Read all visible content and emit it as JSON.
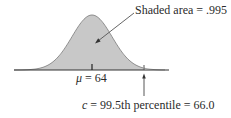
{
  "chart_data": {
    "type": "area",
    "title": "",
    "distribution": "normal",
    "mean": 64,
    "shaded_region": "left of c",
    "shaded_area": 0.995,
    "percentile": 99.5,
    "c_value": 66.0,
    "xlabel": "",
    "ylabel": "",
    "grid": false,
    "legend": "none",
    "annotations": [
      {
        "text": "Shaded area = .995",
        "target": "shaded region"
      },
      {
        "text": "μ = 64",
        "target": "center tick"
      },
      {
        "text": "c = 99.5th percentile = 66.0",
        "target": "right tick"
      }
    ]
  },
  "labels": {
    "shaded_area": "Shaded area = .995",
    "mu_symbol": "μ",
    "mu_rest": " = 64",
    "c_symbol": "c",
    "c_rest": " = 99.5th percentile = 66.0"
  },
  "colors": {
    "shade": "#c8c8c8",
    "curve": "#6e6e6e",
    "axis": "#333333",
    "text": "#2b2b2b"
  }
}
